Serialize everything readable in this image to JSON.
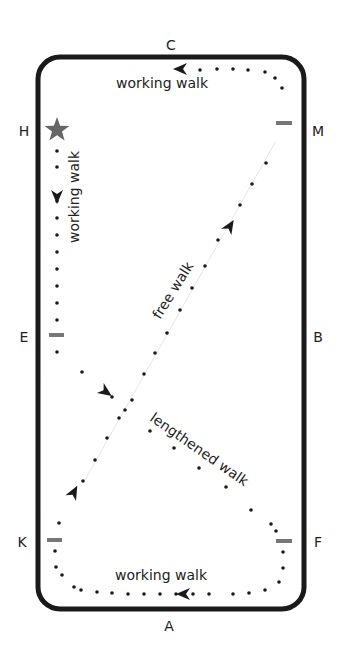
{
  "arena": {
    "x": 38,
    "y": 57,
    "width": 266,
    "height": 552,
    "radius": 22,
    "stroke": "#1a1a1a",
    "stroke_width": 5
  },
  "letters": [
    {
      "id": "C",
      "text": "C",
      "x": 171,
      "y": 50
    },
    {
      "id": "H",
      "text": "H",
      "x": 24,
      "y": 136
    },
    {
      "id": "M",
      "text": "M",
      "x": 318,
      "y": 136
    },
    {
      "id": "E",
      "text": "E",
      "x": 24,
      "y": 342
    },
    {
      "id": "B",
      "text": "B",
      "x": 318,
      "y": 342
    },
    {
      "id": "K",
      "text": "K",
      "x": 22,
      "y": 547
    },
    {
      "id": "F",
      "text": "F",
      "x": 318,
      "y": 547
    },
    {
      "id": "A",
      "text": "A",
      "x": 169,
      "y": 631
    }
  ],
  "markers": [
    {
      "id": "M",
      "x1": 276,
      "x2": 292,
      "y": 123
    },
    {
      "id": "E",
      "x1": 49,
      "x2": 64,
      "y": 335
    },
    {
      "id": "K",
      "x1": 47,
      "x2": 62,
      "y": 540
    },
    {
      "id": "F",
      "x1": 276,
      "x2": 292,
      "y": 541
    }
  ],
  "marker_color": "#777777",
  "start": {
    "symbol": "star",
    "x": 57,
    "y": 130,
    "color": "#666666"
  },
  "labels": [
    {
      "id": "working-walk-top",
      "text": "working walk",
      "x": 116,
      "y": 88,
      "rotate": 0
    },
    {
      "id": "working-walk-left",
      "text": "working walk",
      "x": 79,
      "y": 243,
      "rotate": -90
    },
    {
      "id": "free-walk",
      "text": "free walk",
      "x": 160,
      "y": 320,
      "rotate": -58
    },
    {
      "id": "lengthened-walk",
      "text": "lengthened walk",
      "x": 149,
      "y": 420,
      "rotate": 35
    },
    {
      "id": "working-walk-bottom",
      "text": "working walk",
      "x": 115,
      "y": 580,
      "rotate": 0
    }
  ],
  "paths": {
    "top": [
      [
        282,
        88
      ],
      [
        275,
        78
      ],
      [
        265,
        72
      ],
      [
        248,
        70
      ],
      [
        233,
        69
      ],
      [
        217,
        69
      ],
      [
        200,
        70
      ]
    ],
    "left": [
      [
        57,
        151
      ],
      [
        57,
        167
      ],
      [
        57,
        201
      ],
      [
        57,
        218
      ],
      [
        57,
        235
      ],
      [
        57,
        252
      ],
      [
        57,
        269
      ],
      [
        57,
        286
      ],
      [
        57,
        303
      ],
      [
        57,
        320
      ],
      [
        57,
        352
      ]
    ],
    "lengthened": [
      [
        82,
        372
      ],
      [
        112,
        397
      ],
      [
        150,
        431
      ],
      [
        174,
        448
      ],
      [
        199,
        468
      ],
      [
        226,
        487
      ],
      [
        251,
        510
      ],
      [
        276,
        531
      ]
    ],
    "free": [
      [
        266,
        163
      ],
      [
        252,
        184
      ],
      [
        240,
        205
      ],
      [
        218,
        240
      ],
      [
        205,
        266
      ],
      [
        192,
        288
      ],
      [
        180,
        310
      ],
      [
        167,
        333
      ],
      [
        155,
        353
      ],
      [
        144,
        374
      ],
      [
        132,
        400
      ],
      [
        125,
        410
      ],
      [
        119,
        418
      ],
      [
        107,
        438
      ],
      [
        95,
        460
      ],
      [
        83,
        481
      ]
    ],
    "right_lower": [
      [
        271,
        524
      ],
      [
        283,
        552
      ],
      [
        283,
        568
      ],
      [
        279,
        582
      ],
      [
        265,
        590
      ],
      [
        249,
        593
      ],
      [
        233,
        594
      ]
    ],
    "bottom": [
      [
        209,
        594
      ],
      [
        193,
        594
      ],
      [
        176,
        594
      ],
      [
        160,
        594
      ],
      [
        144,
        594
      ],
      [
        128,
        594
      ],
      [
        112,
        593
      ],
      [
        97,
        592
      ],
      [
        81,
        590
      ],
      [
        74,
        587
      ],
      [
        62,
        575
      ],
      [
        56,
        567
      ],
      [
        55,
        551
      ],
      [
        59,
        523
      ]
    ]
  },
  "arrows": [
    {
      "id": "arrow-top",
      "x": 180,
      "y": 69,
      "angle": 180
    },
    {
      "id": "arrow-left",
      "x": 57,
      "y": 197,
      "angle": 90
    },
    {
      "id": "arrow-free",
      "x": 230,
      "y": 226,
      "angle": -58
    },
    {
      "id": "arrow-lengthened",
      "x": 106,
      "y": 392,
      "angle": 35
    },
    {
      "id": "arrow-free-lower",
      "x": 74,
      "y": 492,
      "angle": -62
    },
    {
      "id": "arrow-bottom",
      "x": 183,
      "y": 594,
      "angle": 180
    }
  ],
  "free_line": {
    "x1": 85,
    "y1": 480,
    "x2": 276,
    "y2": 141,
    "color": "#e6e6e6"
  },
  "dot_color": "#1a1a1a",
  "text_color": "#222222"
}
